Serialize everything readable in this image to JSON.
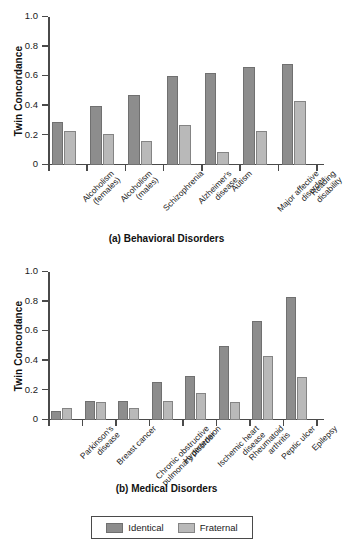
{
  "legend": {
    "position": "bottom-center",
    "entries": [
      {
        "label": "Identical",
        "color": "#8d8d8d",
        "swatch": "identical-swatch"
      },
      {
        "label": "Fraternal",
        "color": "#b9b9b9",
        "swatch": "fraternal-swatch"
      }
    ]
  },
  "chart_data": [
    {
      "type": "bar",
      "panel": "a",
      "title": "(a) Behavioral Disorders",
      "xlabel": "",
      "ylabel": "Twin Concordance",
      "ylim": [
        0,
        1.0
      ],
      "yticks": [
        0,
        0.2,
        0.4,
        0.6,
        0.8,
        1.0
      ],
      "ytick_labels": [
        "0",
        "0.2",
        "0.4",
        "0.6",
        "0.8",
        "1.0"
      ],
      "grid": false,
      "legend_position": "figure-bottom",
      "categories": [
        "Alcoholism (females)",
        "Alcoholism (males)",
        "Schizophrenia",
        "Alzheimer's disease",
        "Autism",
        "Major affective disorder",
        "Reading disability"
      ],
      "category_lines": [
        [
          "Alcoholism",
          "(females)"
        ],
        [
          "Alcoholism",
          "(males)"
        ],
        [
          "Schizophrenia"
        ],
        [
          "Alzheimer's",
          "disease"
        ],
        [
          "Autism"
        ],
        [
          "Major affective",
          "disorder"
        ],
        [
          "Reading",
          "disability"
        ]
      ],
      "series": [
        {
          "name": "Identical",
          "color": "#8d8d8d",
          "values": [
            0.29,
            0.4,
            0.47,
            0.6,
            0.62,
            0.66,
            0.68
          ]
        },
        {
          "name": "Fraternal",
          "color": "#b9b9b9",
          "values": [
            0.23,
            0.21,
            0.16,
            0.27,
            0.09,
            0.23,
            0.43
          ]
        }
      ]
    },
    {
      "type": "bar",
      "panel": "b",
      "title": "(b) Medical Disorders",
      "xlabel": "",
      "ylabel": "Twin Concordance",
      "ylim": [
        0,
        1.0
      ],
      "yticks": [
        0,
        0.2,
        0.4,
        0.6,
        0.8,
        1.0
      ],
      "ytick_labels": [
        "0",
        "0.2",
        "0.4",
        "0.6",
        "0.8",
        "1.0"
      ],
      "grid": false,
      "legend_position": "figure-bottom",
      "categories": [
        "Parkinson's disease",
        "Breast cancer",
        "Chronic obstructive pulmonary disorder",
        "Hypertension",
        "Ischemic heart disease",
        "Rheumatoid arthritis",
        "Peptic ulcer",
        "Epilepsy"
      ],
      "category_lines": [
        [
          "Parkinson's",
          "disease"
        ],
        [
          "Breast cancer"
        ],
        [
          "Chronic obstructive",
          "pulmonary disorder"
        ],
        [
          "Hypertension"
        ],
        [
          "Ischemic heart",
          "disease"
        ],
        [
          "Rheumatoid",
          "arthritis"
        ],
        [
          "Peptic ulcer"
        ],
        [
          "Epilepsy"
        ]
      ],
      "series": [
        {
          "name": "Identical",
          "color": "#8d8d8d",
          "values": [
            0.06,
            0.13,
            0.13,
            0.26,
            0.3,
            0.5,
            0.67,
            0.83
          ]
        },
        {
          "name": "Fraternal",
          "color": "#b9b9b9",
          "values": [
            0.08,
            0.12,
            0.08,
            0.13,
            0.18,
            0.12,
            0.43,
            0.29
          ]
        }
      ]
    }
  ]
}
